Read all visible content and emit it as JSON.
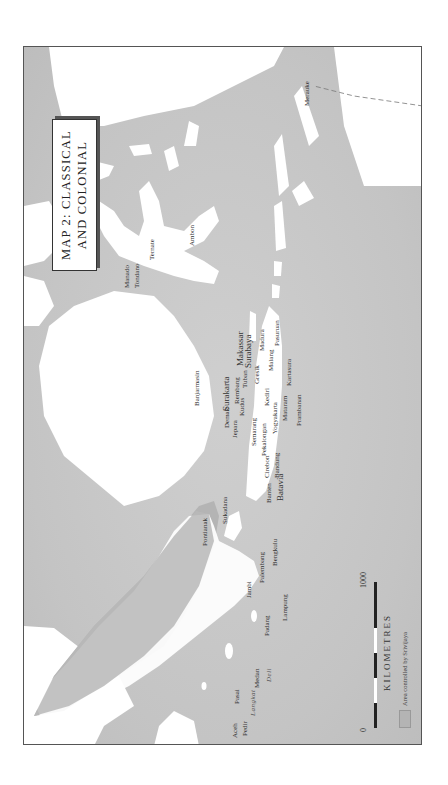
{
  "map": {
    "title_line1": "MAP 2: CLASSICAL",
    "title_line2": "AND COLONIAL",
    "orientation": "rotated 90° counter-clockwise",
    "colors": {
      "sea": "#c9c9c9",
      "land": "#ffffff",
      "srivijaya_area": "#b4b4b4",
      "frame": "#555555"
    }
  },
  "scale": {
    "min_label": "0",
    "max_label": "1000",
    "unit": "KILOMETRES"
  },
  "legend": {
    "items": [
      {
        "label": "Area controlled by Srivijaya",
        "swatch": "#b4b4b4"
      }
    ]
  },
  "places": {
    "sumatra": [
      "Aceh",
      "Pasai",
      "Pedir",
      "Medan",
      "Deli",
      "Padang",
      "Jambi",
      "Palembang",
      "Bengkulu",
      "Lampung"
    ],
    "sumatra_region_label": "Langkat",
    "java": [
      "Batavia",
      "Banten",
      "Cirebon",
      "Bandung",
      "Pekalongan",
      "Semarang",
      "Jepara",
      "Demak",
      "Kudus",
      "Surakarta",
      "Rembang",
      "Tuban",
      "Gresik",
      "Surabaya",
      "Madura",
      "Malang",
      "Kediri",
      "Yogyakarta",
      "Mataram",
      "Kartasura",
      "Prambanan",
      "Pasuruan"
    ],
    "borneo": [
      "Pontianak",
      "Sukadana",
      "Banjarmasin"
    ],
    "sulawesi": [
      "Makassar",
      "Manado",
      "Tondano"
    ],
    "maluku": [
      "Ternate",
      "Ambon"
    ],
    "papua": [
      "Merauke"
    ]
  }
}
